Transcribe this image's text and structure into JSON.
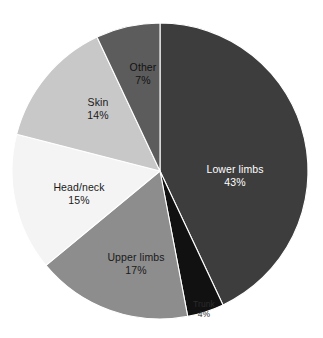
{
  "chart_data": {
    "type": "pie",
    "title": "",
    "subtitle": "",
    "xlabel": "",
    "ylabel": "",
    "legend_position": "none",
    "grid": false,
    "labels_inside": true,
    "value_unit": "%",
    "total": 100,
    "start_angle_deg": 0,
    "direction": "clockwise",
    "categories": [
      "Lower limbs",
      "Trunk",
      "Upper limbs",
      "Head/neck",
      "Skin",
      "Other"
    ],
    "values": [
      43,
      4,
      17,
      15,
      14,
      7
    ],
    "slices": [
      {
        "label": "Lower limbs",
        "value": 43,
        "value_text": "43%",
        "color": "#3d3d3d",
        "text_color": "#ffffff",
        "label_x": 235,
        "label_y": 173,
        "tiny": false
      },
      {
        "label": "Trunk",
        "value": 4,
        "value_text": "4%",
        "color": "#111111",
        "text_color": "#2b2b2b",
        "label_x": 204,
        "label_y": 307,
        "tiny": true
      },
      {
        "label": "Upper limbs",
        "value": 17,
        "value_text": "17%",
        "color": "#8d8d8d",
        "text_color": "#1a1a1a",
        "label_x": 136,
        "label_y": 261,
        "tiny": false
      },
      {
        "label": "Head/neck",
        "value": 15,
        "value_text": "15%",
        "color": "#f4f4f4",
        "text_color": "#1a1a1a",
        "label_x": 79,
        "label_y": 191,
        "tiny": false
      },
      {
        "label": "Skin",
        "value": 14,
        "value_text": "14%",
        "color": "#c8c8c8",
        "text_color": "#1a1a1a",
        "label_x": 98,
        "label_y": 106,
        "tiny": false
      },
      {
        "label": "Other",
        "value": 7,
        "value_text": "7%",
        "color": "#5c5c5c",
        "text_color": "#121212",
        "label_x": 143,
        "label_y": 71,
        "tiny": false
      }
    ],
    "geometry": {
      "center_x": 160,
      "center_y": 171,
      "radius": 148
    },
    "background_color": "#ffffff"
  }
}
